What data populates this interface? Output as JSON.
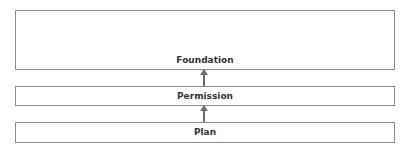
{
  "diagram": {
    "type": "layered-stack",
    "layers": [
      {
        "id": "foundation",
        "label": "Foundation"
      },
      {
        "id": "permission",
        "label": "Permission"
      },
      {
        "id": "plan",
        "label": "Plan"
      }
    ],
    "edges": [
      {
        "from": "permission",
        "to": "foundation",
        "direction": "up"
      },
      {
        "from": "plan",
        "to": "permission",
        "direction": "up"
      }
    ],
    "colors": {
      "border": "#8a8a8a",
      "arrow": "#6b6b6b",
      "text": "#333333",
      "background": "#ffffff"
    }
  }
}
